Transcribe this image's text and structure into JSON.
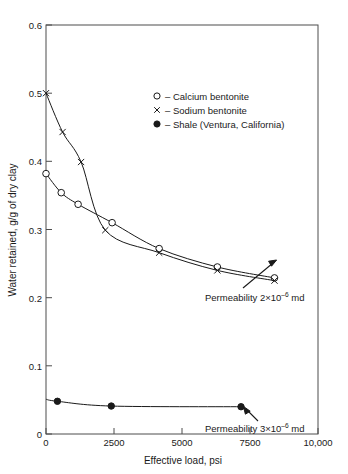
{
  "chart_data": {
    "type": "line",
    "title": "",
    "xlabel": "Effective load, psi",
    "ylabel": "Water retained, g/g of dry clay",
    "xlim": [
      0,
      10000
    ],
    "ylim": [
      0,
      0.6
    ],
    "grid": false,
    "legend_position": "upper-center-right",
    "xticks": [
      0,
      2500,
      5000,
      7500,
      10000
    ],
    "xtick_labels": [
      "0",
      "2500",
      "5000",
      "7500",
      "10,000"
    ],
    "yticks": [
      0,
      0.1,
      0.2,
      0.3,
      0.4,
      0.5,
      0.6
    ],
    "ytick_labels": [
      "0",
      "0.1",
      "0.2",
      "0.3",
      "0.4",
      "0.5",
      "0.6"
    ],
    "series": [
      {
        "name": "Calcium bentonite",
        "marker": "open-circle",
        "legend_symbol": "o",
        "points": [
          {
            "x": 0,
            "y": 0.382
          },
          {
            "x": 560,
            "y": 0.354
          },
          {
            "x": 1180,
            "y": 0.337
          },
          {
            "x": 2430,
            "y": 0.31
          },
          {
            "x": 4160,
            "y": 0.272
          },
          {
            "x": 6300,
            "y": 0.245
          },
          {
            "x": 8400,
            "y": 0.229
          }
        ]
      },
      {
        "name": "Sodium bentonite",
        "marker": "x",
        "legend_symbol": "×",
        "points": [
          {
            "x": 0,
            "y": 0.5
          },
          {
            "x": 610,
            "y": 0.443
          },
          {
            "x": 1290,
            "y": 0.399
          },
          {
            "x": 2180,
            "y": 0.299
          },
          {
            "x": 4160,
            "y": 0.266
          },
          {
            "x": 6300,
            "y": 0.24
          },
          {
            "x": 8400,
            "y": 0.225
          }
        ]
      },
      {
        "name": "Shale (Ventura, California)",
        "marker": "filled-circle",
        "legend_symbol": "●",
        "points": [
          {
            "x": 0,
            "y": 0.051
          },
          {
            "x": 420,
            "y": 0.048
          },
          {
            "x": 2400,
            "y": 0.041
          },
          {
            "x": 7170,
            "y": 0.04
          }
        ]
      }
    ],
    "annotations": [
      {
        "id": "permeability-bentonite",
        "text_prefix": "Permeability 2×10",
        "exponent": "–6",
        "text_suffix": " md",
        "target": {
          "x": 8400,
          "y": 0.229
        }
      },
      {
        "id": "permeability-shale",
        "text_prefix": "Permeability 3×10",
        "exponent": "–6",
        "text_suffix": " md",
        "target": {
          "x": 7170,
          "y": 0.04
        }
      }
    ]
  },
  "legend": {
    "entries": [
      {
        "symbol": "o",
        "dash": "–",
        "label": "Calcium bentonite"
      },
      {
        "symbol": "×",
        "dash": "–",
        "label": "Sodium bentonite"
      },
      {
        "symbol": "●",
        "dash": "–",
        "label": "Shale (Ventura, California)"
      }
    ]
  },
  "colors": {
    "ink": "#1a1a1a",
    "frame": "#4d4d4d",
    "background": "#ffffff"
  }
}
